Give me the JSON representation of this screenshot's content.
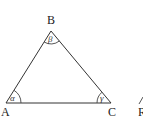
{
  "diagram": {
    "title": "",
    "type": "triangle",
    "stroke_color": "#333333",
    "background": "#ffffff",
    "vertices": [
      {
        "name": "A",
        "x": 6,
        "y": 103,
        "label_x": 1,
        "label_y": 116
      },
      {
        "name": "B",
        "x": 51,
        "y": 31,
        "label_x": 47,
        "label_y": 24
      },
      {
        "name": "C",
        "x": 111,
        "y": 103,
        "label_x": 108,
        "label_y": 116
      }
    ],
    "angles": [
      {
        "vertex": "A",
        "symbol": "α"
      },
      {
        "vertex": "B",
        "symbol": "β"
      },
      {
        "vertex": "C",
        "symbol": "γ"
      }
    ],
    "cropped_right": {
      "label": "R",
      "note": "partially visible neighbouring figure at right edge"
    }
  }
}
